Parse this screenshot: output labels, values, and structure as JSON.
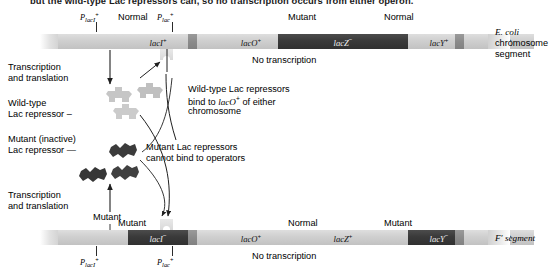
{
  "headline": "but the wild-type Lac repressors can, so no transcription occurs from either operon.",
  "top_chromosome": {
    "caption_line1": "E. coli",
    "caption_line2": "chromosome",
    "caption_line3": "segment",
    "promoters": [
      {
        "name": "P-lacI-plus",
        "base": "P",
        "sub": "lacI",
        "sup": "+"
      },
      {
        "name": "P-lac-plus",
        "base": "P",
        "sub": "lac",
        "sup": "+"
      }
    ],
    "status_labels": [
      {
        "text": "Normal",
        "name": "status-normal-laci"
      },
      {
        "text": "Mutant",
        "name": "status-mutant-lacz"
      },
      {
        "text": "Normal",
        "name": "status-normal-lacy"
      }
    ],
    "genes": [
      {
        "name": "gene-lacI-plus",
        "label": "lacI",
        "sup": "+",
        "state": "light"
      },
      {
        "name": "gene-lacO-plus",
        "label": "lacO",
        "sup": "+",
        "state": "light"
      },
      {
        "name": "gene-lacZ-minus",
        "label": "lacZ",
        "sup": "−",
        "state": "dark"
      },
      {
        "name": "gene-lacY-plus",
        "label": "lacY",
        "sup": "+",
        "state": "light"
      },
      {
        "name": "gene-lacA-plus",
        "label": "lacA",
        "sup": "+",
        "state": "light"
      }
    ],
    "transcription_status": "No transcription"
  },
  "bottom_chromosome": {
    "caption": "F′ segment",
    "promoters": [
      {
        "name": "P-lacI-plus",
        "base": "P",
        "sub": "lacI",
        "sup": "+"
      },
      {
        "name": "P-lac-plus",
        "base": "P",
        "sub": "lac",
        "sup": "+"
      }
    ],
    "status_labels": [
      {
        "text": "Mutant",
        "name": "status-mutant-laci"
      },
      {
        "text": "Normal",
        "name": "status-normal-lacz"
      },
      {
        "text": "Mutant",
        "name": "status-mutant-lacy"
      }
    ],
    "genes": [
      {
        "name": "gene-lacI-minus",
        "label": "lacI",
        "sup": "−",
        "state": "dark"
      },
      {
        "name": "gene-lacO-plus",
        "label": "lacO",
        "sup": "+",
        "state": "light"
      },
      {
        "name": "gene-lacZ-plus",
        "label": "lacZ",
        "sup": "+",
        "state": "light"
      },
      {
        "name": "gene-lacY-minus",
        "label": "lacY",
        "sup": "−",
        "state": "dark"
      },
      {
        "name": "gene-lacA-plus",
        "label": "lacA",
        "sup": "+",
        "state": "light"
      }
    ],
    "transcription_status": "No transcription"
  },
  "annotations": {
    "transcription_top_line1": "Transcription",
    "transcription_top_line2": "and translation",
    "transcription_bottom_line1": "Transcription",
    "transcription_bottom_line2": "and translation",
    "wildtype_repressor_line1": "Wild-type",
    "wildtype_repressor_line2": "Lac repressor",
    "mutant_repressor_line1": "Mutant (inactive)",
    "mutant_repressor_line2": "Lac repressor",
    "binding_note_line1": "Wild-type Lac repressors",
    "binding_note_line2_a": "bind to ",
    "binding_note_line2_b": "lacO",
    "binding_note_line2_sup": "+",
    "binding_note_line2_c": " of either",
    "binding_note_line3": "chromosome",
    "nobind_note_line1": "Mutant Lac repressors",
    "nobind_note_line2": "cannot bind to operators"
  },
  "colors": {
    "gene_light": "#d2d2d2",
    "gene_dark": "#3a3a3a",
    "gene_mid": "#8b8b8b",
    "repressor_wildtype": "#c9c9c9",
    "repressor_mutant": "#3c3c3c",
    "line": "#2b2b2b",
    "text": "#000000"
  }
}
